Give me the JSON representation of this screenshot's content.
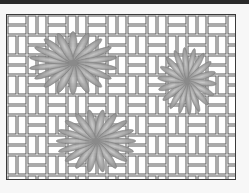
{
  "image": {
    "description": "Basket-weave tile pattern with three gray chrysanthemum flowers",
    "colors": {
      "background": "#f7f7f7",
      "top_bar": "#2a2a2a",
      "weave_line": "#555555",
      "weave_fill": "#ffffff",
      "petal": "#9a9a9a",
      "petal_highlight": "#c8c8c8"
    },
    "flowers": [
      {
        "name": "flower-top-left",
        "cx": 72,
        "cy": 62,
        "scale": 1.0
      },
      {
        "name": "flower-right",
        "cx": 186,
        "cy": 80,
        "scale": 0.7
      },
      {
        "name": "flower-bottom",
        "cx": 95,
        "cy": 140,
        "scale": 0.9
      }
    ]
  }
}
